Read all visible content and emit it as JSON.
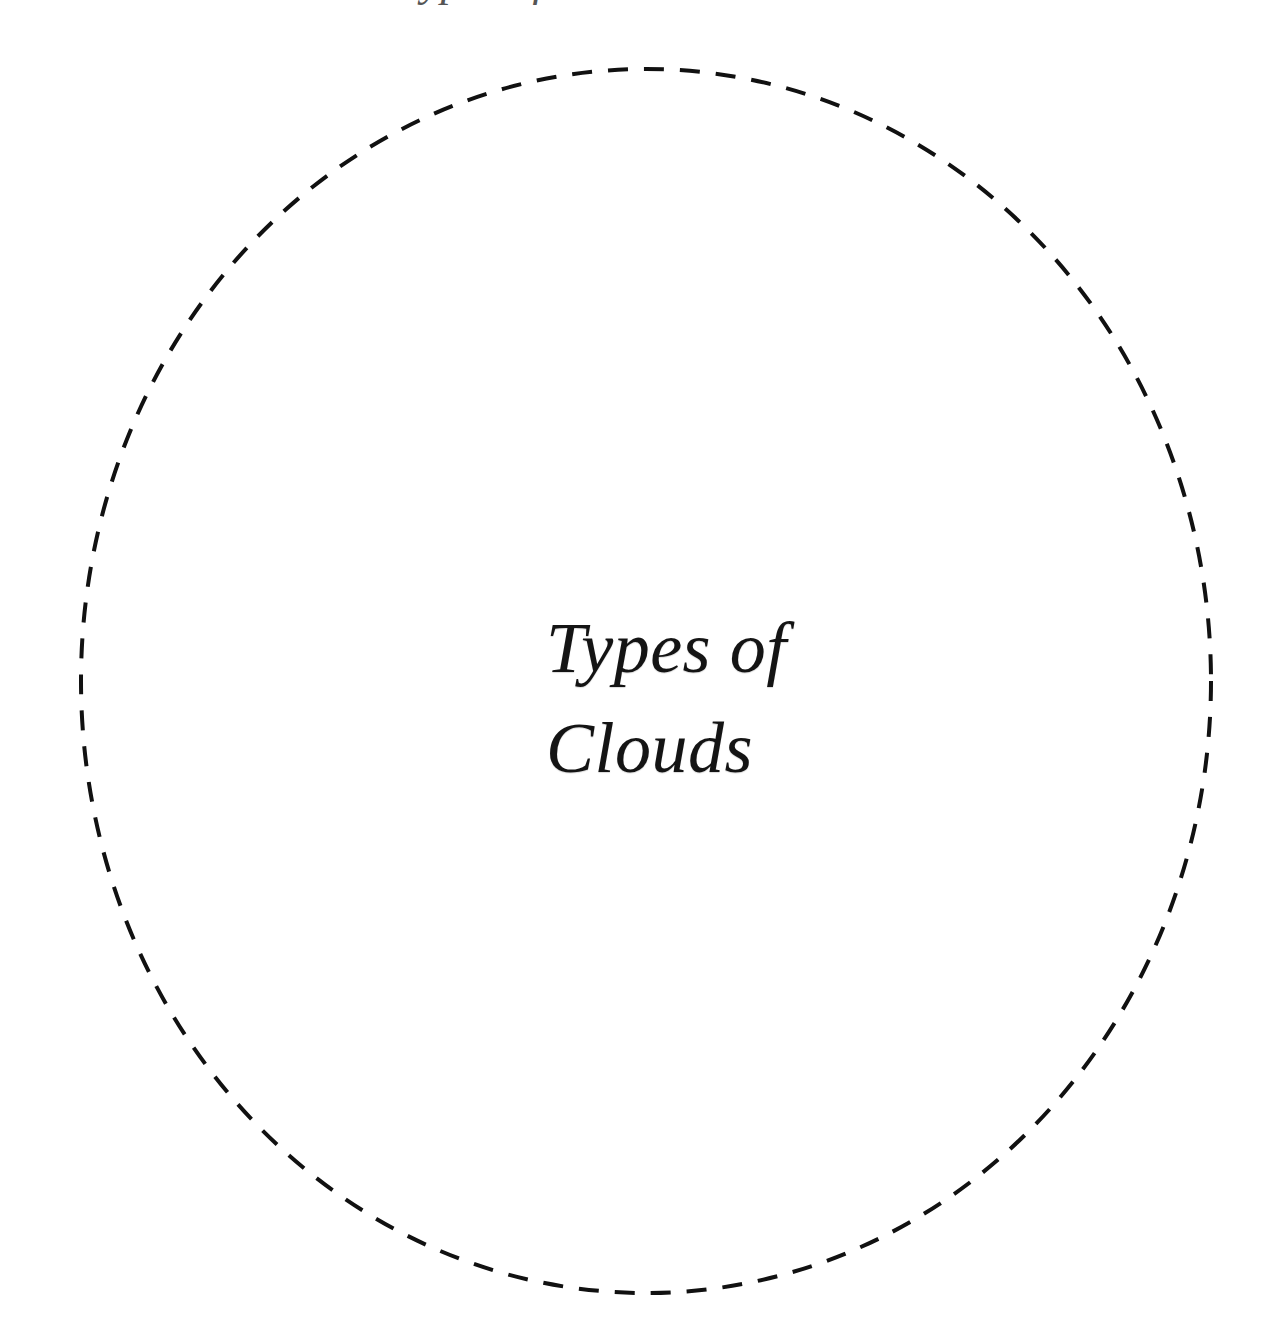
{
  "page": {
    "clipped_top_text": "Types of Clouds",
    "title_lines": [
      "Types of",
      "Clouds"
    ],
    "shape": {
      "type": "dashed-circle",
      "stroke_color": "#111111",
      "cx": 646,
      "cy": 681,
      "rx": 565,
      "ry": 612,
      "stroke_width": 4,
      "dash": "20 16"
    },
    "colors": {
      "background": "#ffffff",
      "text": "#141414"
    }
  }
}
